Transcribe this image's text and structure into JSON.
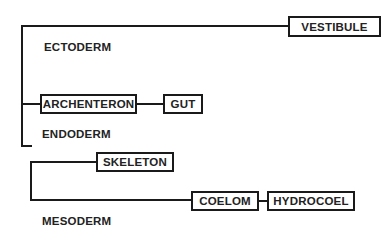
{
  "diagram": {
    "type": "tree",
    "groups": [
      {
        "label": "ECTODERM"
      },
      {
        "label": "ENDODERM"
      },
      {
        "label": "MESODERM"
      }
    ],
    "nodes": {
      "vestibule": "VESTIBULE",
      "archenteron": "ARCHENTERON",
      "gut": "GUT",
      "skeleton": "SKELETON",
      "coelom": "COELOM",
      "hydrocoel": "HYDROCOEL"
    },
    "edges": [
      [
        "root",
        "vestibule"
      ],
      [
        "root",
        "archenteron"
      ],
      [
        "archenteron",
        "gut"
      ],
      [
        "root",
        "mesoderm-branch"
      ],
      [
        "mesoderm-branch",
        "skeleton"
      ],
      [
        "mesoderm-branch",
        "coelom"
      ],
      [
        "coelom",
        "hydrocoel"
      ]
    ],
    "colors": {
      "line": "#1a1a1a",
      "text": "#222222",
      "background": "#ffffff"
    }
  }
}
